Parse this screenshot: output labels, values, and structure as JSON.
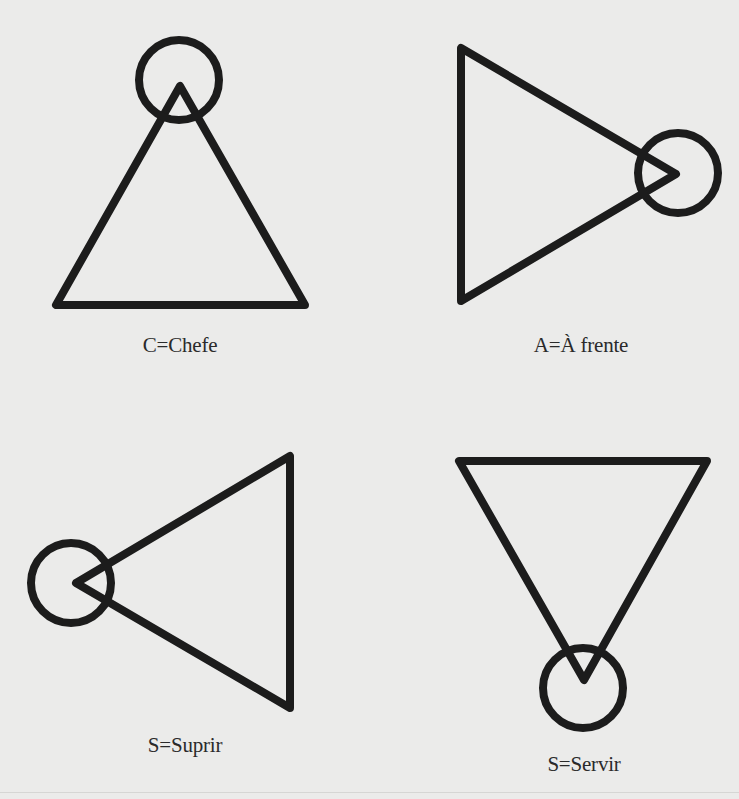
{
  "figures": [
    {
      "id": "chefe",
      "label": "C=Chefe",
      "orientation": "apex-up",
      "triangle": [
        [
          180,
          86
        ],
        [
          56,
          305
        ],
        [
          305,
          305
        ]
      ],
      "circle": {
        "cx": 179,
        "cy": 80,
        "r": 40
      },
      "label_pos": {
        "x": 180,
        "y": 333
      }
    },
    {
      "id": "a-frente",
      "label": "A=À frente",
      "orientation": "apex-right",
      "triangle": [
        [
          461,
          48
        ],
        [
          461,
          301
        ],
        [
          676,
          174
        ]
      ],
      "circle": {
        "cx": 678,
        "cy": 173,
        "r": 40
      },
      "label_pos": {
        "x": 581,
        "y": 333
      }
    },
    {
      "id": "suprir",
      "label": "S=Suprir",
      "orientation": "apex-left",
      "triangle": [
        [
          290,
          456
        ],
        [
          290,
          708
        ],
        [
          76,
          583
        ]
      ],
      "circle": {
        "cx": 71,
        "cy": 583,
        "r": 40
      },
      "label_pos": {
        "x": 185,
        "y": 733
      }
    },
    {
      "id": "servir",
      "label": "S=Servir",
      "orientation": "apex-down",
      "triangle": [
        [
          459,
          461
        ],
        [
          707,
          461
        ],
        [
          584,
          680
        ]
      ],
      "circle": {
        "cx": 583,
        "cy": 688,
        "r": 40
      },
      "label_pos": {
        "x": 584,
        "y": 752
      }
    }
  ],
  "style": {
    "stroke": "#1c1c1c",
    "stroke_width": 8,
    "background": "#ebebea",
    "label_color": "#2a2a2a"
  }
}
